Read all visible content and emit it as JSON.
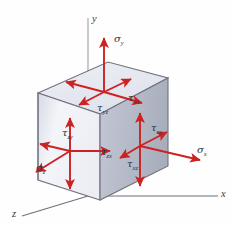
{
  "figure": {
    "background_color": "#fefefe",
    "arrow_color": "#cc2222",
    "label_color": "#2d3142",
    "axis_color": "#8a8d96",
    "cube": {
      "top_face_color": "#e8eaf2",
      "front_face_color": "#f2f3f8",
      "right_face_color": "#b9bdcb",
      "edge_color": "#6a6d79"
    }
  },
  "axes": [
    {
      "name": "y-axis",
      "label": "y",
      "direction": "up"
    },
    {
      "name": "x-axis",
      "label": "x",
      "direction": "right-down"
    },
    {
      "name": "z-axis",
      "label": "z",
      "direction": "left-down"
    }
  ],
  "stresses": [
    {
      "name": "sigma-y",
      "symbol": "σ",
      "subscript": "y",
      "type": "normal",
      "face": "top",
      "direction": "up"
    },
    {
      "name": "tau-yx",
      "symbol": "τ",
      "subscript": "yx",
      "type": "shear",
      "face": "top",
      "direction": "right-down"
    },
    {
      "name": "tau-yz",
      "symbol": "τ",
      "subscript": "yz",
      "type": "shear",
      "face": "top",
      "direction": "left-down"
    },
    {
      "name": "sigma-x",
      "symbol": "σ",
      "subscript": "x",
      "type": "normal",
      "face": "right",
      "direction": "right-down"
    },
    {
      "name": "tau-xy",
      "symbol": "τ",
      "subscript": "xy",
      "type": "shear",
      "face": "right",
      "direction": "up"
    },
    {
      "name": "tau-xz",
      "symbol": "τ",
      "subscript": "xz",
      "type": "shear",
      "face": "right",
      "direction": "left-down"
    },
    {
      "name": "sigma-z",
      "symbol": "σ",
      "subscript": "z",
      "type": "normal",
      "face": "front",
      "direction": "left-down"
    },
    {
      "name": "tau-zy",
      "symbol": "τ",
      "subscript": "zy",
      "type": "shear",
      "face": "front",
      "direction": "up"
    },
    {
      "name": "tau-zx",
      "symbol": "τ",
      "subscript": "zx",
      "type": "shear",
      "face": "front",
      "direction": "right"
    }
  ],
  "labels": {
    "axis_y": "y",
    "axis_x": "x",
    "axis_z": "z",
    "sigma": "σ",
    "tau": "τ",
    "sub_y": "y",
    "sub_x": "x",
    "sub_z": "z",
    "sub_yx": "yx",
    "sub_yz": "yz",
    "sub_xy": "xy",
    "sub_xz": "xz",
    "sub_zy": "zy",
    "sub_zx": "zx"
  }
}
